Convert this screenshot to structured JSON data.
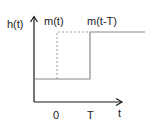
{
  "diagram": {
    "labels": {
      "y_axis": "h(t)",
      "signal_original": "m(t)",
      "signal_shifted": "m(t-T)",
      "x_tick_zero": "0",
      "x_tick_T": "T",
      "x_axis": "t"
    },
    "colors": {
      "axis": "#1a1a1a",
      "solid_signal": "#8a8a8a",
      "dashed_signal": "#9a9a9a",
      "text": "#222222"
    }
  }
}
